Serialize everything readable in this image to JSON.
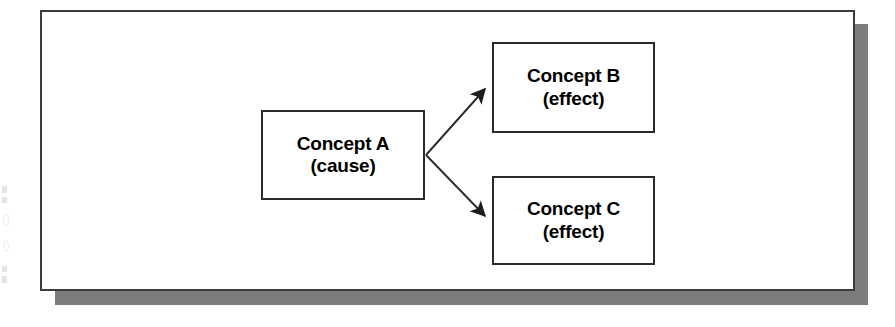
{
  "diagram": {
    "panel": {
      "background_color": "#ffffff",
      "border_color": "#3d3d3d",
      "shadow_color": "#7c7c7c"
    },
    "nodes": [
      {
        "id": "a",
        "title": "Concept A",
        "subtitle": "(cause)",
        "role": "cause",
        "border_color": "#2b2b2b",
        "fill_color": "#ffffff"
      },
      {
        "id": "b",
        "title": "Concept B",
        "subtitle": "(effect)",
        "role": "effect",
        "border_color": "#2b2b2b",
        "fill_color": "#ffffff"
      },
      {
        "id": "c",
        "title": "Concept C",
        "subtitle": "(effect)",
        "role": "effect",
        "border_color": "#2b2b2b",
        "fill_color": "#ffffff"
      }
    ],
    "connectors": [
      {
        "id": "a-to-b",
        "from": "a",
        "to": "b",
        "label": "",
        "arrowhead": "filled-triangle",
        "stroke_color": "#2b2b2b"
      },
      {
        "id": "a-to-c",
        "from": "a",
        "to": "c",
        "label": "",
        "arrowhead": "filled-triangle",
        "stroke_color": "#2b2b2b"
      }
    ]
  }
}
